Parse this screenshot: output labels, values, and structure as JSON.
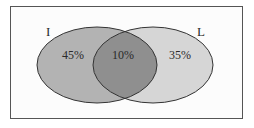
{
  "diagram": {
    "type": "venn",
    "sets": [
      {
        "label": "I",
        "only_value": "45%",
        "fill": "#b3b3b3"
      },
      {
        "label": "L",
        "only_value": "35%",
        "fill": "#d6d6d6"
      }
    ],
    "intersection": {
      "value": "10%",
      "fill": "#8f8f8f"
    },
    "colors": {
      "border": "#3a3a3a",
      "background": "#ffffff"
    }
  }
}
